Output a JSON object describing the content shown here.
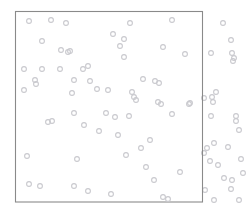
{
  "figure": {
    "kind": "point-pattern-scatter",
    "width": 251,
    "height": 217,
    "background_color": "#ffffff",
    "title": "",
    "subtitle": "",
    "axis_labels": {
      "x": "",
      "y": ""
    },
    "tick_labels": [],
    "legend": [],
    "annotations": []
  },
  "window": {
    "name": "observation-window",
    "shape": "rectangle",
    "x": 15.5,
    "y": 11.5,
    "width": 187,
    "height": 190.5,
    "stroke_color": "#8a8a8a",
    "stroke_width": 1.1,
    "fill": "none"
  },
  "marker_style": {
    "shape": "circle",
    "radius": 2.4,
    "stroke_color": "#c9c9ce",
    "stroke_width": 1.1,
    "fill": "none"
  },
  "chart_data": {
    "type": "scatter",
    "title": "",
    "xlabel": "",
    "ylabel": "",
    "xlim": [
      0,
      251
    ],
    "ylim": [
      0,
      217
    ],
    "grid": false,
    "legend_position": "none",
    "marker": "open-circle",
    "marker_color": "#c9c9ce",
    "coordinate_space": "pixels, y increases downward",
    "window_rect": {
      "x0": 15.5,
      "y0": 11.5,
      "x1": 202.5,
      "y1": 202.0
    },
    "n_points_inside": 63,
    "n_points_outside": 28,
    "n_points_total": 91,
    "series": [
      {
        "name": "points-inside-window",
        "inside_window": true,
        "color": "#c9c9ce",
        "points": [
          [
            29,
            21
          ],
          [
            51,
            20
          ],
          [
            66,
            23
          ],
          [
            130,
            23
          ],
          [
            172,
            20
          ],
          [
            113,
            34
          ],
          [
            42,
            41
          ],
          [
            124,
            39
          ],
          [
            120,
            46
          ],
          [
            61,
            50
          ],
          [
            68,
            52
          ],
          [
            70,
            51
          ],
          [
            163,
            47
          ],
          [
            124,
            57
          ],
          [
            185,
            54
          ],
          [
            24,
            69
          ],
          [
            42,
            69
          ],
          [
            88,
            66
          ],
          [
            35,
            80
          ],
          [
            36,
            84
          ],
          [
            60,
            69
          ],
          [
            74,
            80
          ],
          [
            83,
            69
          ],
          [
            90,
            81
          ],
          [
            24,
            90
          ],
          [
            143,
            79
          ],
          [
            155,
            81
          ],
          [
            159,
            83
          ],
          [
            132,
            92
          ],
          [
            134,
            97
          ],
          [
            136,
            100
          ],
          [
            158,
            102
          ],
          [
            161,
            104
          ],
          [
            190,
            103
          ],
          [
            74,
            113
          ],
          [
            106,
            113
          ],
          [
            115,
            117
          ],
          [
            129,
            116
          ],
          [
            172,
            114
          ],
          [
            48,
            122
          ],
          [
            84,
            125
          ],
          [
            99,
            131
          ],
          [
            118,
            135
          ],
          [
            150,
            140
          ],
          [
            141,
            148
          ],
          [
            189,
            104
          ],
          [
            27,
            156
          ],
          [
            77,
            159
          ],
          [
            126,
            155
          ],
          [
            146,
            167
          ],
          [
            29,
            184
          ],
          [
            40,
            186
          ],
          [
            74,
            186
          ],
          [
            88,
            191
          ],
          [
            111,
            194
          ],
          [
            154,
            180
          ],
          [
            180,
            172
          ],
          [
            163,
            197
          ],
          [
            168,
            199
          ],
          [
            108,
            90
          ],
          [
            97,
            89
          ],
          [
            72,
            93
          ],
          [
            52,
            121
          ]
        ]
      },
      {
        "name": "points-outside-window",
        "inside_window": false,
        "color": "#c9c9ce",
        "points": [
          [
            223,
            23
          ],
          [
            231,
            40
          ],
          [
            211,
            53
          ],
          [
            232,
            53
          ],
          [
            234,
            58
          ],
          [
            233,
            61
          ],
          [
            216,
            92
          ],
          [
            212,
            97
          ],
          [
            204,
            98
          ],
          [
            213,
            102
          ],
          [
            211,
            116
          ],
          [
            236,
            116
          ],
          [
            207,
            148
          ],
          [
            214,
            143
          ],
          [
            204,
            153
          ],
          [
            210,
            161
          ],
          [
            218,
            165
          ],
          [
            228,
            147
          ],
          [
            224,
            178
          ],
          [
            232,
            180
          ],
          [
            231,
            189
          ],
          [
            205,
            190
          ],
          [
            236,
            121
          ],
          [
            239,
            130
          ],
          [
            241,
            159
          ],
          [
            243,
            173
          ],
          [
            214,
            200
          ],
          [
            239,
            200
          ]
        ]
      }
    ]
  }
}
